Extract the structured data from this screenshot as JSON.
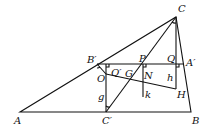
{
  "diagram": {
    "points": {
      "A": {
        "label": "A",
        "x": 20,
        "y": 112
      },
      "B": {
        "label": "B",
        "x": 191,
        "y": 112
      },
      "C": {
        "label": "C",
        "x": 176,
        "y": 17
      },
      "A_prime": {
        "label": "A′",
        "x": 184,
        "y": 64
      },
      "B_prime": {
        "label": "B′",
        "x": 97,
        "y": 64
      },
      "C_prime": {
        "label": "C′",
        "x": 106,
        "y": 112
      },
      "O": {
        "label": "O",
        "x": 106,
        "y": 74
      },
      "P": {
        "label": "P",
        "x": 143,
        "y": 64
      },
      "Q": {
        "label": "Q",
        "x": 176,
        "y": 64
      },
      "Q_prime": {
        "label": "Q′",
        "x": 115,
        "y": 64
      },
      "G": {
        "label": "G",
        "x": 129,
        "y": 78
      },
      "N": {
        "label": "N",
        "x": 143,
        "y": 82
      },
      "H": {
        "label": "H",
        "x": 176,
        "y": 89
      }
    },
    "segment_labels": {
      "g": "g",
      "h": "h",
      "k": "k"
    }
  }
}
